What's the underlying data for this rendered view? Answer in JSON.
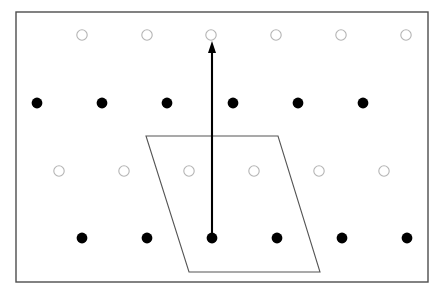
{
  "figure": {
    "width": 443,
    "height": 294,
    "background_color": "#ffffff"
  },
  "frame": {
    "name": "figure-border",
    "x": 16,
    "y": 12,
    "width": 412,
    "height": 270,
    "stroke_color": "#4d4d4d",
    "stroke_width": 1.4,
    "fill": "none"
  },
  "lattice": {
    "rows": [
      {
        "id": "row-1-open",
        "marker": "open-circle",
        "y": 35,
        "radius": 5.2,
        "fill": "#ffffff",
        "stroke_color": "#b4b4b4",
        "stroke_width": 1.1,
        "x_positions": [
          82,
          147,
          211,
          276,
          341,
          406
        ]
      },
      {
        "id": "row-2-filled",
        "marker": "filled-circle",
        "y": 103,
        "radius": 5.4,
        "fill": "#000000",
        "stroke_color": "#000000",
        "stroke_width": 0,
        "x_positions": [
          37,
          102,
          167,
          233,
          298,
          363
        ]
      },
      {
        "id": "row-3-open",
        "marker": "open-circle",
        "y": 171,
        "radius": 5.2,
        "fill": "#ffffff",
        "stroke_color": "#b4b4b4",
        "stroke_width": 1.1,
        "x_positions": [
          59,
          124,
          189,
          254,
          319,
          384
        ]
      },
      {
        "id": "row-4-filled",
        "marker": "filled-circle",
        "y": 238,
        "radius": 5.4,
        "fill": "#000000",
        "stroke_color": "#000000",
        "stroke_width": 0,
        "x_positions": [
          82,
          147,
          212,
          277,
          342,
          407
        ]
      }
    ]
  },
  "unit_cell": {
    "name": "parallelogram-unit-cell",
    "points": "146,136 278,136 320,272 189,272",
    "stroke_color": "#555555",
    "stroke_width": 1.1,
    "fill": "none"
  },
  "vector": {
    "name": "translation-vector-arrow",
    "x_start": 212,
    "y_start": 237,
    "x_end": 212,
    "y_end": 41,
    "stroke_color": "#000000",
    "stroke_width": 2.1,
    "head_width": 8,
    "head_length": 12
  }
}
